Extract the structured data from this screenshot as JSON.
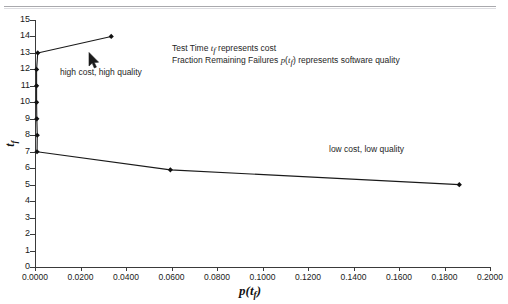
{
  "chart_data": {
    "type": "line",
    "title": "",
    "xlabel": "p(t_f)",
    "ylabel": "t_f",
    "xlabel_main": "p",
    "xlabel_sub": "f",
    "ylabel_main": "t",
    "ylabel_sub": "f",
    "xlim": [
      0.0,
      0.2
    ],
    "ylim": [
      0,
      15
    ],
    "xticks": [
      "0.0000",
      "0.0200",
      "0.0400",
      "0.0600",
      "0.0800",
      "0.1000",
      "0.1200",
      "0.1400",
      "0.1600",
      "0.1800",
      "0.2000"
    ],
    "xtick_values": [
      0.0,
      0.02,
      0.04,
      0.06,
      0.08,
      0.1,
      0.12,
      0.14,
      0.16,
      0.18,
      0.2
    ],
    "yticks": [
      "0",
      "1",
      "2",
      "3",
      "4",
      "5",
      "6",
      "7",
      "8",
      "9",
      "10",
      "11",
      "12",
      "13",
      "14",
      "15"
    ],
    "ytick_values": [
      0,
      1,
      2,
      3,
      4,
      5,
      6,
      7,
      8,
      9,
      10,
      11,
      12,
      13,
      14,
      15
    ],
    "grid": false,
    "legend": false,
    "line_color": "#1a1a1a",
    "marker": "diamond",
    "marker_color": "#111111",
    "series": [
      {
        "name": "tradeoff curve",
        "points": [
          {
            "x": 0.0335,
            "y": 14.0
          },
          {
            "x": 0.0012,
            "y": 13.0
          },
          {
            "x": 0.0007,
            "y": 12.0
          },
          {
            "x": 0.0007,
            "y": 11.0
          },
          {
            "x": 0.0007,
            "y": 10.0
          },
          {
            "x": 0.0008,
            "y": 9.0
          },
          {
            "x": 0.001,
            "y": 8.0
          },
          {
            "x": 0.0009,
            "y": 7.0
          },
          {
            "x": 0.0595,
            "y": 5.9
          },
          {
            "x": 0.1865,
            "y": 5.0
          }
        ]
      }
    ],
    "annotations": [
      {
        "name": "note-cost",
        "text": "Test Time t_f represents cost",
        "x": 0.06,
        "y": 13.2
      },
      {
        "name": "note-quality",
        "text": "Fraction Remaining Failures p(t_f) represents software quality",
        "x": 0.06,
        "y": 12.5
      },
      {
        "name": "high-corner",
        "text": "high cost, high quality",
        "x": 0.011,
        "y": 11.8
      },
      {
        "name": "low-corner",
        "text": "low cost, low quality",
        "x": 0.129,
        "y": 6.6
      }
    ]
  },
  "annotations": {
    "note_cost_pre": "Test Time ",
    "note_cost_var": "t",
    "note_cost_sub": "f",
    "note_cost_post": " represents cost",
    "note_quality_pre": "Fraction Remaining Failures ",
    "note_quality_var": "p",
    "note_quality_open": "(",
    "note_quality_var2": "t",
    "note_quality_sub": "f",
    "note_quality_close": ")",
    "note_quality_post": " represents software quality",
    "high_quality_label": "high cost, high quality",
    "low_quality_label": "low cost, low quality"
  },
  "cursor": {
    "name": "mouse-pointer",
    "x": 88,
    "y": 52
  }
}
